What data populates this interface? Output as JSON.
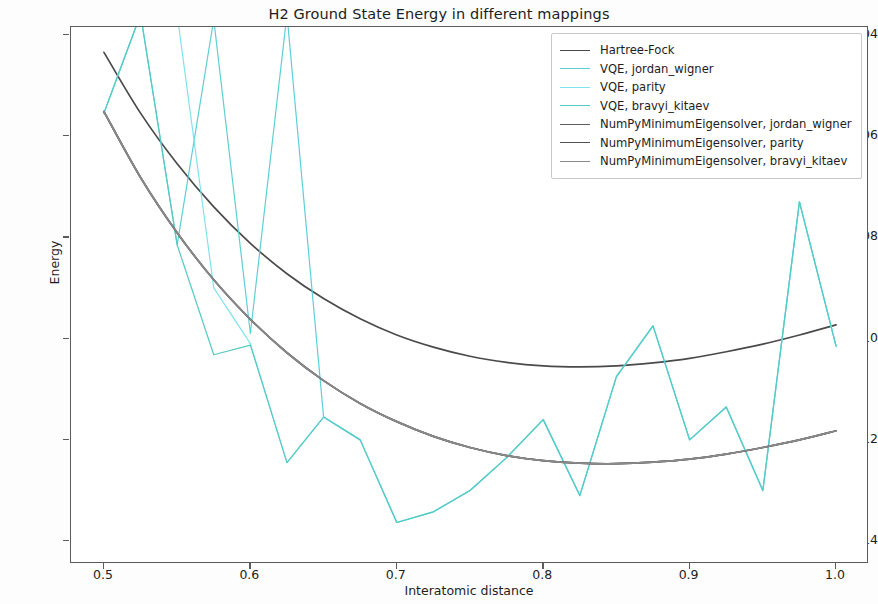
{
  "chart_data": {
    "type": "line",
    "title": "H2 Ground State Energy in different mappings",
    "xlabel": "Interatomic distance",
    "ylabel": "Energy",
    "xlim": [
      0.4775,
      1.0225
    ],
    "ylim": [
      -1.1445,
      -1.0385
    ],
    "xticks": [
      0.5,
      0.6,
      0.7,
      0.8,
      0.9,
      1.0
    ],
    "xtick_labels": [
      "0.5",
      "0.6",
      "0.7",
      "0.8",
      "0.9",
      "1.0"
    ],
    "yticks": [
      -1.04,
      -1.06,
      -1.08,
      -1.1,
      -1.12,
      -1.14
    ],
    "ytick_labels": [
      "−1.04",
      "−1.06",
      "−1.08",
      "−1.10",
      "−1.12",
      "−1.14"
    ],
    "grid": false,
    "legend_position": "upper right",
    "x": [
      0.5,
      0.525,
      0.55,
      0.575,
      0.6,
      0.625,
      0.65,
      0.675,
      0.7,
      0.725,
      0.75,
      0.775,
      0.8,
      0.825,
      0.85,
      0.875,
      0.9,
      0.925,
      0.95,
      0.975,
      1.0
    ],
    "series": [
      {
        "name": "Hartree-Fock",
        "color": "#4a4a4a",
        "linewidth": 1.7,
        "values": [
          -1.0435,
          -1.0555,
          -1.0655,
          -1.074,
          -1.0812,
          -1.0872,
          -1.0921,
          -1.0961,
          -1.0993,
          -1.1017,
          -1.1035,
          -1.1047,
          -1.1054,
          -1.1056,
          -1.1054,
          -1.1048,
          -1.1039,
          -1.1026,
          -1.1011,
          -1.0993,
          -1.0973
        ]
      },
      {
        "name": "VQE, jordan_wigner",
        "color": "#5ecfd4",
        "linewidth": 1.2,
        "values": [
          -1.0555,
          -1.036,
          -1.0815,
          -1.037,
          -1.099,
          -1.036,
          -1.1155,
          -1.12,
          -1.1363,
          -1.1342,
          -1.13,
          -1.1235,
          -1.116,
          -1.131,
          -1.1075,
          -1.0975,
          -1.12,
          -1.1135,
          -1.13,
          -1.073,
          -1.1015
        ]
      },
      {
        "name": "VQE, parity",
        "color": "#7fe3ee",
        "linewidth": 1.2,
        "values": [
          -1.0555,
          -1.036,
          -1.036,
          -1.09,
          -1.101,
          -1.1245,
          -1.1155,
          -1.12,
          -1.1363,
          -1.1342,
          -1.13,
          -1.1235,
          -1.116,
          -1.131,
          -1.1075,
          -1.0975,
          -1.12,
          -1.1135,
          -1.13,
          -1.073,
          -1.1015
        ]
      },
      {
        "name": "VQE, bravyi_kitaev",
        "color": "#55c9c3",
        "linewidth": 1.2,
        "values": [
          -1.0555,
          -1.036,
          -1.0815,
          -1.1032,
          -1.1013,
          -1.1245,
          -1.1155,
          -1.12,
          -1.1363,
          -1.1342,
          -1.13,
          -1.1235,
          -1.116,
          -1.131,
          -1.1075,
          -1.0975,
          -1.12,
          -1.1135,
          -1.13,
          -1.073,
          -1.1015
        ]
      },
      {
        "name": "NumPyMinimumEigensolver, jordan_wigner",
        "color": "#5e5e5e",
        "linewidth": 1.7,
        "values": [
          -1.0552,
          -1.0682,
          -1.0791,
          -1.0884,
          -1.0962,
          -1.1028,
          -1.1083,
          -1.1128,
          -1.1164,
          -1.1193,
          -1.1215,
          -1.1231,
          -1.1241,
          -1.1246,
          -1.1247,
          -1.1244,
          -1.1238,
          -1.1228,
          -1.1215,
          -1.12,
          -1.1182
        ]
      },
      {
        "name": "NumPyMinimumEigensolver, parity",
        "color": "#525252",
        "linewidth": 1.7,
        "values": [
          -1.0552,
          -1.0682,
          -1.0791,
          -1.0884,
          -1.0962,
          -1.1028,
          -1.1083,
          -1.1128,
          -1.1164,
          -1.1193,
          -1.1215,
          -1.1231,
          -1.1241,
          -1.1246,
          -1.1247,
          -1.1244,
          -1.1238,
          -1.1228,
          -1.1215,
          -1.12,
          -1.1182
        ]
      },
      {
        "name": "NumPyMinimumEigensolver, bravyi_kitaev",
        "color": "#8a8a8a",
        "linewidth": 1.7,
        "values": [
          -1.0552,
          -1.0682,
          -1.0791,
          -1.0884,
          -1.0962,
          -1.1028,
          -1.1083,
          -1.1128,
          -1.1164,
          -1.1193,
          -1.1215,
          -1.1231,
          -1.1241,
          -1.1246,
          -1.1247,
          -1.1244,
          -1.1238,
          -1.1228,
          -1.1215,
          -1.12,
          -1.1182
        ]
      }
    ],
    "legend_entries": [
      {
        "label": "Hartree-Fock",
        "color": "#4a4a4a"
      },
      {
        "label": "VQE, jordan_wigner",
        "color": "#5ecfd4"
      },
      {
        "label": "VQE, parity",
        "color": "#7fe3ee"
      },
      {
        "label": "VQE, bravyi_kitaev",
        "color": "#55c9c3"
      },
      {
        "label": "NumPyMinimumEigensolver, jordan_wigner",
        "color": "#5e5e5e"
      },
      {
        "label": "NumPyMinimumEigensolver, parity",
        "color": "#525252"
      },
      {
        "label": "NumPyMinimumEigensolver, bravyi_kitaev",
        "color": "#8a8a8a"
      }
    ]
  }
}
